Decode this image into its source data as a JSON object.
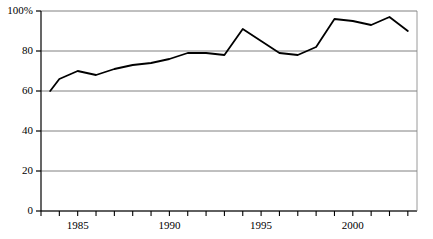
{
  "chart_data": {
    "type": "line",
    "title": "",
    "subtitle": "",
    "xlabel": "",
    "ylabel": "",
    "xlim": [
      1983,
      2003.5
    ],
    "ylim": [
      0,
      100
    ],
    "grid": true,
    "grid_axis": "y",
    "legend": false,
    "legend_position": "none",
    "line_color": "#000000",
    "line_width": 1.8,
    "grid_color": "#808080",
    "axis_color": "#000000",
    "background_color": "#ffffff",
    "y_ticks": [
      0,
      20,
      40,
      60,
      80,
      100
    ],
    "y_tick_labels": [
      "0",
      "20",
      "40",
      "60",
      "80",
      "100%"
    ],
    "x_ticks": [
      1983,
      1984,
      1985,
      1986,
      1987,
      1988,
      1989,
      1990,
      1991,
      1992,
      1993,
      1994,
      1995,
      1996,
      1997,
      1998,
      1999,
      2000,
      2001,
      2002,
      2003
    ],
    "x_tick_labels": [
      "",
      "",
      "1985",
      "",
      "",
      "",
      "",
      "1990",
      "",
      "",
      "",
      "",
      "1995",
      "",
      "",
      "",
      "",
      "2000",
      "",
      "",
      ""
    ],
    "x_labeled_ticks": [
      {
        "value": 1985,
        "label": "1985"
      },
      {
        "value": 1990,
        "label": "1990"
      },
      {
        "value": 1995,
        "label": "1995"
      },
      {
        "value": 2000,
        "label": "2000"
      }
    ],
    "x": [
      1983.5,
      1984,
      1985,
      1986,
      1987,
      1988,
      1989,
      1990,
      1991,
      1992,
      1993,
      1994,
      1995,
      1996,
      1997,
      1998,
      1999,
      2000,
      2001,
      2002,
      2003
    ],
    "values": [
      60,
      66,
      70,
      68,
      71,
      73,
      74,
      76,
      79,
      79,
      78,
      91,
      85,
      79,
      78,
      82,
      96,
      95,
      93,
      97,
      90
    ],
    "series": [
      {
        "name": "series-1",
        "values": [
          60,
          66,
          70,
          68,
          71,
          73,
          74,
          76,
          79,
          79,
          78,
          91,
          85,
          79,
          78,
          82,
          96,
          95,
          93,
          97,
          90
        ]
      }
    ]
  }
}
